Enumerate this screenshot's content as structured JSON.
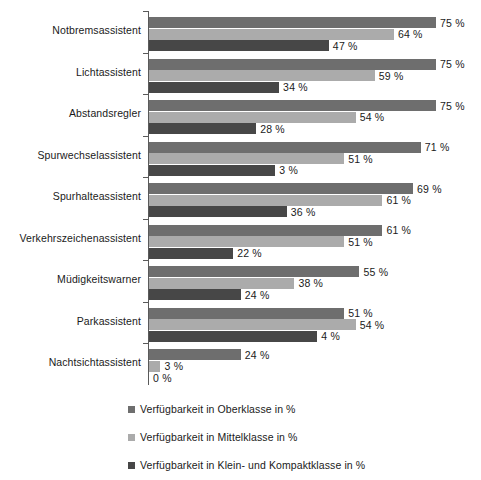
{
  "chart_data": {
    "type": "bar",
    "orientation": "horizontal",
    "title": "",
    "subtitle": "",
    "xlabel": "",
    "ylabel": "",
    "xlim": [
      0,
      75
    ],
    "grid": false,
    "legend_position": "bottom",
    "value_suffix": "%",
    "categories": [
      "Notbremsassistent",
      "Lichtassistent",
      "Abstandsregler",
      "Spurwechselassistent",
      "Spurhalteassistent",
      "Verkehrszeichenassistent",
      "Müdigkeitswarner",
      "Parkassistent",
      "Nachtsichtassistent"
    ],
    "series": [
      {
        "name": "Verfügbarkeit in Oberklasse in %",
        "color": "#6e6e6e",
        "values": [
          75,
          75,
          75,
          71,
          69,
          61,
          55,
          51,
          24
        ],
        "labels": [
          "75 %",
          "75 %",
          "75 %",
          "71 %",
          "69 %",
          "61 %",
          "55 %",
          "51 %",
          "24 %"
        ]
      },
      {
        "name": "Verfügbarkeit in Mittelklasse in %",
        "color": "#ababab",
        "values": [
          64,
          59,
          54,
          51,
          61,
          51,
          38,
          54,
          3
        ],
        "labels": [
          "64 %",
          "59 %",
          "54 %",
          "51 %",
          "61 %",
          "51 %",
          "38 %",
          "54 %",
          "3 %"
        ]
      },
      {
        "name": "Verfügbarkeit in Klein- und Kompaktklasse in %",
        "color": "#474747",
        "values": [
          47,
          34,
          28,
          33,
          36,
          22,
          24,
          44,
          0
        ],
        "labels": [
          "47 %",
          "34 %",
          "28 %",
          "3 %",
          "36 %",
          "22 %",
          "24 %",
          "4 %",
          "0 %"
        ]
      }
    ]
  },
  "legend": {
    "items": [
      {
        "label": "Verfügbarkeit in Oberklasse in %",
        "swatch": "legend-swatch-oberklasse"
      },
      {
        "label": "Verfügbarkeit in Mittelklasse in %",
        "swatch": "legend-swatch-mittelklasse"
      },
      {
        "label": "Verfügbarkeit in Klein- und Kompaktklasse in %",
        "swatch": "legend-swatch-kleinklasse"
      }
    ]
  }
}
